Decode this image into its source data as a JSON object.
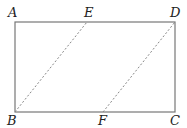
{
  "diagram": {
    "type": "geometry",
    "shape": "rectangle with two dashed segments",
    "points": {
      "A": {
        "label": "A",
        "x": 15,
        "y": 22
      },
      "E": {
        "label": "E",
        "x": 87,
        "y": 22
      },
      "D": {
        "label": "D",
        "x": 175,
        "y": 22
      },
      "B": {
        "label": "B",
        "x": 15,
        "y": 112
      },
      "F": {
        "label": "F",
        "x": 103,
        "y": 112
      },
      "C": {
        "label": "C",
        "x": 175,
        "y": 112
      }
    },
    "solid_edges": [
      "AD",
      "DC",
      "CB",
      "BA"
    ],
    "dashed_segments": [
      "BE",
      "FD"
    ],
    "colors": {
      "line": "#777777",
      "label": "#222222"
    }
  }
}
